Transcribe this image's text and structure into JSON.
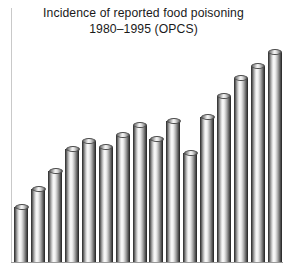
{
  "chart_data": {
    "type": "bar",
    "title": "Incidence of reported food poisoning 1980–1995 (OPCS)",
    "title_line1": "Incidence of reported food poisoning",
    "title_line2": "1980–1995 (OPCS)",
    "xlabel": "",
    "ylabel": "",
    "grid": false,
    "legend": false,
    "axis_tick_labels_visible": false,
    "categories": [
      "1980",
      "1981",
      "1982",
      "1983",
      "1984",
      "1985",
      "1986",
      "1987",
      "1988",
      "1989",
      "1990",
      "1991",
      "1992",
      "1993",
      "1994",
      "1995"
    ],
    "values": [
      56,
      74,
      92,
      114,
      122,
      116,
      128,
      138,
      124,
      142,
      110,
      146,
      168,
      186,
      198,
      212
    ],
    "ylim": [
      0,
      220
    ],
    "series_name": "Reported food poisoning cases",
    "bar_style": "3d-cylinder",
    "bar_color": "#b5b5b5",
    "bar_outline_color": "#3a3a3a",
    "axis_color": "#9a9a9a",
    "background_color": "#ffffff",
    "text_color": "#1a1a1a"
  },
  "figure": {
    "caption_present": false
  }
}
